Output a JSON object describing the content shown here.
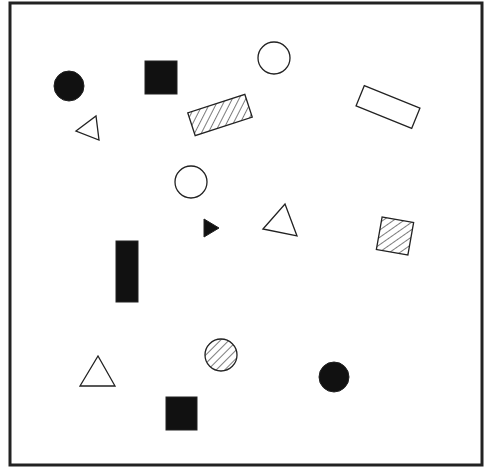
{
  "diagram": {
    "width": 497,
    "height": 476,
    "frame": {
      "x": 10,
      "y": 3,
      "w": 472,
      "h": 462,
      "stroke": "#222222",
      "stroke_width": 3
    },
    "colors": {
      "ink": "#222222",
      "fill_solid": "#111111",
      "background": "#ffffff"
    },
    "shapes": [
      {
        "id": "circle-solid-1",
        "type": "circle",
        "fill": "solid",
        "cx": 69,
        "cy": 86,
        "r": 15
      },
      {
        "id": "square-solid-1",
        "type": "rect",
        "fill": "solid",
        "x": 145,
        "y": 61,
        "w": 32,
        "h": 33,
        "rotate": 0
      },
      {
        "id": "circle-outline-1",
        "type": "circle",
        "fill": "none",
        "cx": 274,
        "cy": 58,
        "r": 16
      },
      {
        "id": "rect-hatched-1",
        "type": "rect",
        "fill": "hatched",
        "cx": 220,
        "cy": 115,
        "w": 60,
        "h": 24,
        "rotate": -18
      },
      {
        "id": "rect-outline-1",
        "type": "rect",
        "fill": "none",
        "cx": 388,
        "cy": 107,
        "w": 60,
        "h": 22,
        "rotate": 22
      },
      {
        "id": "triangle-outline-1",
        "type": "polygon",
        "fill": "none",
        "points": "76,131 96,116 99,140"
      },
      {
        "id": "circle-outline-2",
        "type": "circle",
        "fill": "none",
        "cx": 191,
        "cy": 182,
        "r": 16
      },
      {
        "id": "triangle-solid-1",
        "type": "polygon",
        "fill": "solid",
        "points": "204,219 219,228 204,237"
      },
      {
        "id": "triangle-outline-2",
        "type": "polygon",
        "fill": "none",
        "points": "263,229 285,204 297,236"
      },
      {
        "id": "square-hatched-1",
        "type": "rect",
        "fill": "hatched",
        "cx": 395,
        "cy": 236,
        "w": 32,
        "h": 33,
        "rotate": 10
      },
      {
        "id": "rect-solid-tall-1",
        "type": "rect",
        "fill": "solid",
        "x": 116,
        "y": 241,
        "w": 22,
        "h": 61,
        "rotate": 0
      },
      {
        "id": "triangle-outline-3",
        "type": "polygon",
        "fill": "none",
        "points": "80,386 98,356 115,386"
      },
      {
        "id": "circle-hatched-1",
        "type": "circle",
        "fill": "hatched",
        "cx": 221,
        "cy": 355,
        "r": 16
      },
      {
        "id": "circle-solid-2",
        "type": "circle",
        "fill": "solid",
        "cx": 334,
        "cy": 377,
        "r": 15
      },
      {
        "id": "square-solid-2",
        "type": "rect",
        "fill": "solid",
        "x": 166,
        "y": 397,
        "w": 31,
        "h": 33,
        "rotate": 0
      }
    ]
  }
}
